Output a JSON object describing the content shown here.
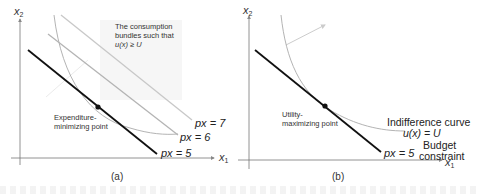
{
  "panels": [
    {
      "id": "a",
      "caption": "(a)",
      "axes": {
        "x_label": "x",
        "x_sub": "1",
        "y_label": "x",
        "y_sub": "2"
      },
      "region_label": [
        "The consumption",
        "bundles such that",
        "u(x) ≥ U"
      ],
      "point_label": [
        "Expenditure-",
        "minimizing point"
      ],
      "lines": [
        {
          "label": "px = 7",
          "color": "#c8c8c8"
        },
        {
          "label": "px = 6",
          "color": "#b4b4b4"
        },
        {
          "label": "px = 5",
          "color": "#111111"
        }
      ]
    },
    {
      "id": "b",
      "caption": "(b)",
      "axes": {
        "x_label": "x",
        "x_sub": "1",
        "y_label": "x",
        "y_sub": "2"
      },
      "point_label": [
        "Utility-",
        "maximizing point"
      ],
      "curve_label": [
        "Indifference curve",
        "u(x) = U"
      ],
      "budget_label": [
        "Budget",
        "constraint"
      ],
      "line_label": "px = 5"
    }
  ],
  "colors": {
    "axis": "#777777",
    "curve": "#aaaaaa",
    "budget": "#111111",
    "arrow": "#cccccc"
  }
}
